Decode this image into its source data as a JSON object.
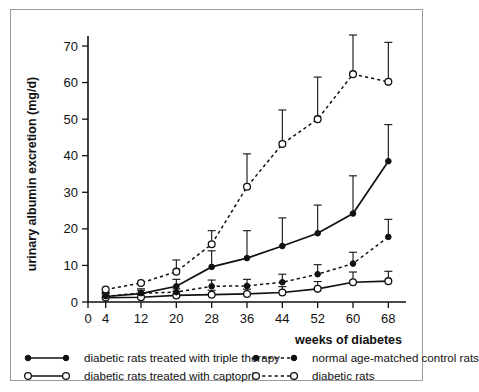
{
  "chart_data": {
    "type": "line",
    "title": "",
    "xlabel": "weeks of diabetes",
    "ylabel": "urinary albumin excretion (mg/d)",
    "x": [
      4,
      12,
      20,
      28,
      36,
      44,
      52,
      60,
      68
    ],
    "xticks": [
      0,
      4,
      12,
      20,
      28,
      36,
      44,
      52,
      60,
      68
    ],
    "yticks": [
      0,
      10,
      20,
      30,
      40,
      50,
      60,
      70
    ],
    "xlim": [
      0,
      72
    ],
    "ylim": [
      0,
      73
    ],
    "grid": false,
    "legend_position": "bottom",
    "errorbars": "upper-only (SEM)",
    "series": [
      {
        "name": "diabetic rats treated with triple therapy",
        "marker": "filled-circle",
        "line": "solid",
        "values": [
          1.5,
          2.3,
          4.3,
          9.6,
          12.0,
          15.3,
          18.8,
          24.2,
          38.5
        ],
        "err_upper": [
          2.6,
          3.6,
          6.2,
          14.0,
          19.5,
          23.0,
          26.5,
          34.5,
          48.5
        ]
      },
      {
        "name": "diabetic rats treated with captopril",
        "marker": "open-circle",
        "line": "solid",
        "values": [
          1.2,
          1.3,
          1.8,
          2.0,
          2.2,
          2.6,
          3.6,
          5.4,
          5.7
        ],
        "err_upper": [
          2.2,
          2.3,
          2.9,
          3.2,
          3.5,
          4.2,
          5.6,
          8.2,
          8.4
        ]
      },
      {
        "name": "normal age-matched control rats",
        "marker": "filled-circle",
        "line": "dashed",
        "values": [
          1.6,
          2.4,
          2.7,
          4.3,
          4.4,
          5.4,
          7.6,
          10.5,
          17.8
        ],
        "err_upper": [
          2.4,
          3.2,
          3.6,
          6.0,
          6.2,
          7.6,
          10.2,
          13.6,
          22.6
        ]
      },
      {
        "name": "diabetic rats",
        "marker": "open-circle",
        "line": "dashed",
        "values": [
          3.4,
          5.2,
          8.3,
          15.8,
          31.5,
          43.2,
          50.0,
          62.3,
          60.2
        ],
        "err_upper": [
          3.4,
          5.2,
          11.5,
          19.5,
          40.5,
          52.5,
          61.5,
          73.0,
          71.0
        ]
      }
    ]
  },
  "legend": {
    "items": [
      {
        "label": "diabetic rats treated with triple therapy",
        "marker": "filled-circle",
        "line": "solid"
      },
      {
        "label": "diabetic rats treated with captopril",
        "marker": "open-circle",
        "line": "solid"
      },
      {
        "label": "normal age-matched control rats",
        "marker": "filled-circle",
        "line": "dashed"
      },
      {
        "label": "diabetic rats",
        "marker": "open-circle",
        "line": "dashed"
      }
    ]
  }
}
